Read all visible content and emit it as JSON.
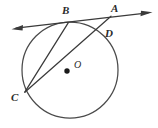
{
  "figure": {
    "background_color": "#ffffff",
    "stroke_color": "#3a3a3a",
    "label_color": "#2b2b2b",
    "width": 158,
    "height": 128
  },
  "circle": {
    "name": "circle-O",
    "center_x": 70,
    "center_y": 70,
    "radius": 48,
    "stroke_color": "#4a4a4a",
    "stroke_width": 1.2
  },
  "center_point": {
    "label": "O",
    "x": 67,
    "y": 71,
    "label_x": 74,
    "label_y": 68,
    "dot_radius": 2.6
  },
  "points": [
    {
      "id": "A",
      "label": "A",
      "x": 110,
      "y": 16.5,
      "label_x": 112,
      "label_y": 11
    },
    {
      "id": "B",
      "label": "B",
      "x": 68,
      "y": 22.4,
      "label_x": 63,
      "label_y": 14
    },
    {
      "id": "C",
      "label": "C",
      "x": 24.5,
      "y": 92.5,
      "label_x": 12,
      "label_y": 101
    },
    {
      "id": "D",
      "label": "D",
      "x": 102.5,
      "y": 28.5,
      "label_x": 105,
      "label_y": 36
    }
  ],
  "segments": [
    {
      "id": "tangent-line",
      "label": "tangent through B",
      "x1": 13,
      "y1": 28.5,
      "x2": 151,
      "y2": 12.5,
      "arrow_start": true,
      "arrow_end": true
    },
    {
      "id": "chord-CB",
      "label": "chord C to B",
      "x1": 24.5,
      "y1": 92.5,
      "x2": 68,
      "y2": 22.4,
      "arrow_start": false,
      "arrow_end": false
    },
    {
      "id": "secant-CA",
      "label": "secant C through D to A",
      "x1": 24.5,
      "y1": 92.5,
      "x2": 110.5,
      "y2": 16.5,
      "arrow_start": false,
      "arrow_end": false
    }
  ],
  "arrowheads": {
    "left_arrow_tip_x": 13,
    "left_arrow_tip_y": 28.5,
    "right_arrow_tip_x": 151,
    "right_arrow_tip_y": 12.5
  }
}
